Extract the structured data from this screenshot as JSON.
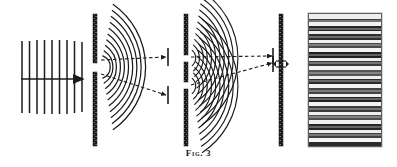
{
  "figure": {
    "caption_label": "Fig.",
    "caption_number": "3",
    "ink_color": "#1b1b1b",
    "background_color": "#ffffff"
  },
  "panels": [
    {
      "id": "plane-waves",
      "name": "incident-plane-wavefronts",
      "description": "Parallel straight wavefronts travelling to the right",
      "x": 20,
      "y": 38,
      "width": 62,
      "height": 76,
      "wavefront_count": 9,
      "wavefront_spacing": 7.5,
      "arrow": {
        "x1": 22,
        "y1": 79,
        "x2": 82,
        "y2": 79,
        "label": "propagation-direction"
      }
    },
    {
      "id": "single-slit-barrier",
      "name": "first-barrier-single-slit",
      "description": "Opaque screen pierced by one narrow slit",
      "x": 93,
      "top": 14,
      "bottom": 146,
      "thickness": 4,
      "slits": [
        {
          "y_start": 63,
          "y_end": 72
        }
      ]
    },
    {
      "id": "single-slit-waves",
      "name": "diffracted-circular-wavefronts",
      "description": "Circular wavefronts spreading from the single slit",
      "source_x": 95,
      "source_y": 67,
      "arc_count": 10,
      "arc_spacing": 7.2,
      "first_radius": 12,
      "half_angle_deg": 46,
      "rays": [
        {
          "x1": 100,
          "y1": 59,
          "x2": 165,
          "y2": 56,
          "label": "ray-upper"
        },
        {
          "x1": 100,
          "y1": 75,
          "x2": 165,
          "y2": 95,
          "label": "ray-lower"
        }
      ]
    },
    {
      "id": "double-slit-barrier",
      "name": "second-barrier-double-slit",
      "description": "Opaque screen pierced by two narrow slits",
      "x": 184,
      "top": 14,
      "bottom": 146,
      "thickness": 4,
      "slits": [
        {
          "y_start": 55,
          "y_end": 62
        },
        {
          "y_start": 82,
          "y_end": 89
        }
      ]
    },
    {
      "id": "interference-waves",
      "name": "overlapping-circular-wavefronts",
      "description": "Two families of circular wavefronts crossing to form interference",
      "sources": [
        {
          "x": 186,
          "y": 58,
          "arc_count": 11
        },
        {
          "x": 186,
          "y": 86,
          "arc_count": 11
        }
      ],
      "arc_spacing": 7.0,
      "first_radius": 10,
      "half_angle_deg": 52,
      "rays": [
        {
          "x1": 190,
          "y1": 56,
          "x2": 272,
          "y2": 56,
          "label": "ray-central"
        },
        {
          "x1": 190,
          "y1": 84,
          "x2": 272,
          "y2": 62,
          "label": "ray-oblique"
        }
      ]
    },
    {
      "id": "observation-screen",
      "name": "third-barrier-observation-screen",
      "description": "Solid screen on which fringes are received",
      "x": 279,
      "top": 14,
      "bottom": 146,
      "thickness": 4,
      "marker": {
        "y": 64,
        "label": "screen-marker-arrow"
      }
    },
    {
      "id": "fringe-photograph",
      "name": "interference-fringe-pattern",
      "description": "Photographic record of the banded interference fringes",
      "x": 308,
      "y": 13,
      "width": 74,
      "height": 134,
      "band_count": 34,
      "band_type": "alternating dark and light horizontal bands"
    }
  ]
}
